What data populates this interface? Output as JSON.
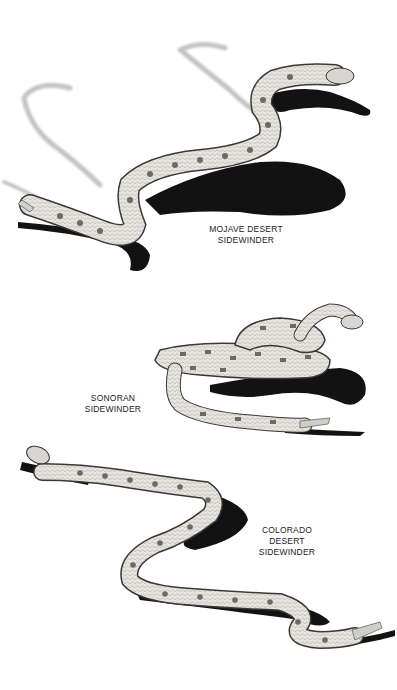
{
  "figure": {
    "background_color": "#ffffff",
    "snake_body_color": "#e4e2dc",
    "snake_blotch_color": "#6d6a64",
    "shadow_color": "#111111",
    "track_color": "#c9c9c9"
  },
  "snakes": [
    {
      "name": "mojave",
      "label_lines": [
        "MOJAVE DESERT",
        "SIDEWINDER"
      ]
    },
    {
      "name": "sonoran",
      "label_lines": [
        "SONORAN",
        "SIDEWINDER"
      ]
    },
    {
      "name": "colorado",
      "label_lines": [
        "COLORADO",
        "DESERT",
        "SIDEWINDER"
      ]
    }
  ]
}
